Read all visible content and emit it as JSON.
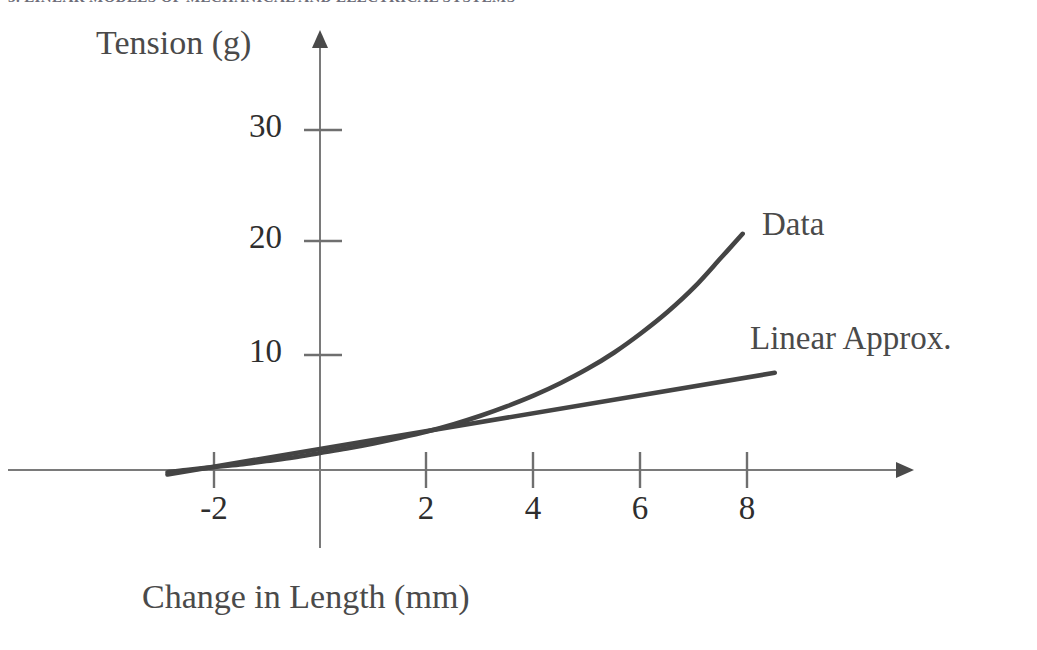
{
  "header": {
    "text": "3. LINEAR MODELS OF MECHANICAL AND ELECTRICAL SYSTEMS"
  },
  "chart_data": {
    "type": "line",
    "title": "",
    "xlabel": "Change in Length (mm)",
    "ylabel": "Tension (g)",
    "xlim": [
      -2.85,
      9.5
    ],
    "ylim": [
      -2.0,
      35.0
    ],
    "grid": false,
    "legend_position": "inline-right-of-curves",
    "axis_style": "arrow-ended cartesian axes crossing at origin",
    "xticks": [
      -2,
      2,
      4,
      6,
      8
    ],
    "xtick_labels": [
      "-2",
      "2",
      "4",
      "6",
      "8"
    ],
    "yticks": [
      10,
      20,
      30
    ],
    "ytick_labels": [
      "10",
      "20",
      "30"
    ],
    "series": [
      {
        "name": "Data",
        "style": "curve",
        "label": "Data",
        "color": "#444444",
        "x": [
          -2.85,
          -2.5,
          -2.0,
          -1.5,
          -1.0,
          -0.5,
          0.0,
          0.5,
          1.0,
          1.5,
          2.0,
          2.5,
          3.0,
          3.5,
          4.0,
          4.5,
          5.0,
          5.5,
          6.0,
          6.5,
          7.0,
          7.5,
          7.9
        ],
        "y": [
          -0.2,
          0.0,
          0.25,
          0.5,
          0.8,
          1.1,
          1.5,
          1.9,
          2.35,
          2.85,
          3.4,
          4.05,
          4.8,
          5.65,
          6.6,
          7.7,
          8.95,
          10.4,
          12.1,
          14.0,
          16.2,
          18.8,
          20.9
        ]
      },
      {
        "name": "Linear Approx.",
        "style": "straight-line",
        "label": "Linear Approx.",
        "color": "#444444",
        "x": [
          -2.85,
          8.5
        ],
        "y": [
          -0.4,
          8.6
        ]
      }
    ],
    "annotations": [
      {
        "text": "Data",
        "x": 8.3,
        "y": 21.5
      },
      {
        "text": "Linear Approx.",
        "x": 8.1,
        "y": 11.3
      }
    ],
    "colors": {
      "curve": "#444444",
      "axis": "#777777",
      "tick_label": "#2e2e2e",
      "axis_title": "#4a4a4a",
      "background": "#ffffff"
    }
  }
}
